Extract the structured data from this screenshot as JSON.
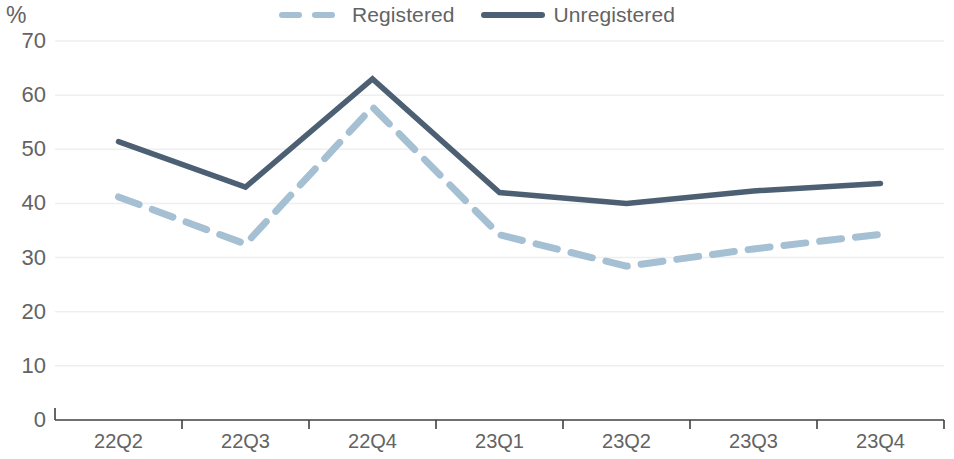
{
  "chart_data": {
    "type": "line",
    "title": "",
    "subtitle": "",
    "xlabel": "",
    "ylabel": "%",
    "ylim": [
      0,
      70
    ],
    "ytick_values": [
      0,
      10,
      20,
      30,
      40,
      50,
      60,
      70
    ],
    "ytick_labels": [
      "0",
      "10",
      "20",
      "30",
      "40",
      "50",
      "60",
      "70"
    ],
    "categories": [
      "22Q2",
      "22Q3",
      "22Q4",
      "23Q1",
      "23Q2",
      "23Q3",
      "23Q4"
    ],
    "grid": "horizontal",
    "legend_position": "top-center",
    "series": [
      {
        "name": "Registered",
        "style": "dashed",
        "color": "#a5bfd3",
        "values": [
          41.2,
          32.5,
          57.8,
          34.2,
          28.4,
          31.6,
          34.3
        ]
      },
      {
        "name": "Unregistered",
        "style": "solid",
        "color": "#4c5f73",
        "values": [
          51.4,
          43.0,
          63.0,
          42.0,
          40.0,
          42.3,
          43.7
        ]
      }
    ]
  },
  "legend": {
    "items": [
      {
        "label": "Registered",
        "swatch": "dashed-line-swatch"
      },
      {
        "label": "Unregistered",
        "swatch": "solid-line-swatch"
      }
    ]
  },
  "axes": {
    "y_unit_label": "%",
    "y_ticks": [
      "70",
      "60",
      "50",
      "40",
      "30",
      "20",
      "10",
      "0"
    ],
    "x_ticks": [
      "22Q2",
      "22Q3",
      "22Q4",
      "23Q1",
      "23Q2",
      "23Q3",
      "23Q4"
    ]
  },
  "colors": {
    "registered": "#a5bfd3",
    "unregistered": "#4c5f73",
    "gridline": "#efefef",
    "axis": "#404040",
    "text": "#636363"
  }
}
